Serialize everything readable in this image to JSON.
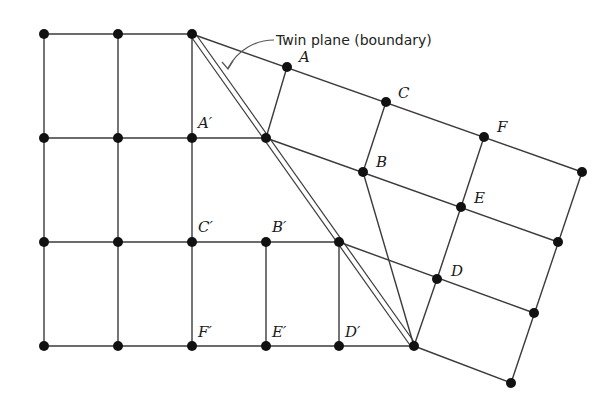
{
  "diagram": {
    "caption": "Twin plane (boundary)",
    "colors": {
      "line": "#3a3a3a",
      "node": "#111111",
      "background": "#ffffff"
    },
    "nodes": [
      {
        "id": "l00",
        "x": 44,
        "y": 34
      },
      {
        "id": "l01",
        "x": 118,
        "y": 34
      },
      {
        "id": "l02",
        "x": 192,
        "y": 34
      },
      {
        "id": "l10",
        "x": 44,
        "y": 138
      },
      {
        "id": "l11",
        "x": 118,
        "y": 138
      },
      {
        "id": "l12",
        "x": 192,
        "y": 138
      },
      {
        "id": "t1",
        "x": 266,
        "y": 138
      },
      {
        "id": "l20",
        "x": 44,
        "y": 242
      },
      {
        "id": "l21",
        "x": 118,
        "y": 242
      },
      {
        "id": "l22",
        "x": 192,
        "y": 242
      },
      {
        "id": "l23",
        "x": 266,
        "y": 242
      },
      {
        "id": "t2",
        "x": 339,
        "y": 242
      },
      {
        "id": "l30",
        "x": 44,
        "y": 346
      },
      {
        "id": "l31",
        "x": 118,
        "y": 346
      },
      {
        "id": "l32",
        "x": 192,
        "y": 346
      },
      {
        "id": "l33",
        "x": 266,
        "y": 346
      },
      {
        "id": "l34",
        "x": 339,
        "y": 346
      },
      {
        "id": "t3",
        "x": 414,
        "y": 346
      },
      {
        "id": "A",
        "x": 287,
        "y": 67
      },
      {
        "id": "C",
        "x": 386,
        "y": 102
      },
      {
        "id": "F",
        "x": 484,
        "y": 137
      },
      {
        "id": "r0",
        "x": 582,
        "y": 172
      },
      {
        "id": "B",
        "x": 363,
        "y": 172
      },
      {
        "id": "E",
        "x": 461,
        "y": 207
      },
      {
        "id": "r1",
        "x": 558,
        "y": 242
      },
      {
        "id": "D",
        "x": 437,
        "y": 279
      },
      {
        "id": "r2",
        "x": 534,
        "y": 313
      },
      {
        "id": "r3",
        "x": 511,
        "y": 383
      }
    ],
    "edges": [
      [
        "l00",
        "l02"
      ],
      [
        "l10",
        "t1"
      ],
      [
        "l20",
        "t2"
      ],
      [
        "l30",
        "t3"
      ],
      [
        "l00",
        "l30"
      ],
      [
        "l01",
        "l31"
      ],
      [
        "l02",
        "l32"
      ],
      [
        "l23",
        "l33"
      ],
      [
        "t2",
        "l34"
      ],
      [
        "l02",
        "r0"
      ],
      [
        "t1",
        "r1"
      ],
      [
        "t2",
        "r2"
      ],
      [
        "t3",
        "r3"
      ],
      [
        "t1",
        "A"
      ],
      [
        "B",
        "C"
      ],
      [
        "D",
        "E"
      ],
      [
        "E",
        "F"
      ],
      [
        "B",
        "t3"
      ],
      [
        "D",
        "t3"
      ],
      [
        "r0",
        "r3"
      ]
    ],
    "labels": [
      {
        "text": "A",
        "x": 299,
        "y": 62
      },
      {
        "text": "C",
        "x": 398,
        "y": 98
      },
      {
        "text": "F",
        "x": 497,
        "y": 132
      },
      {
        "text": "A′",
        "x": 198,
        "y": 128
      },
      {
        "text": "B",
        "x": 376,
        "y": 167
      },
      {
        "text": "E",
        "x": 474,
        "y": 203
      },
      {
        "text": "C′",
        "x": 198,
        "y": 232
      },
      {
        "text": "B′",
        "x": 272,
        "y": 232
      },
      {
        "text": "D",
        "x": 451,
        "y": 276
      },
      {
        "text": "F′",
        "x": 198,
        "y": 337
      },
      {
        "text": "E′",
        "x": 272,
        "y": 337
      },
      {
        "text": "D′",
        "x": 345,
        "y": 337
      }
    ]
  }
}
